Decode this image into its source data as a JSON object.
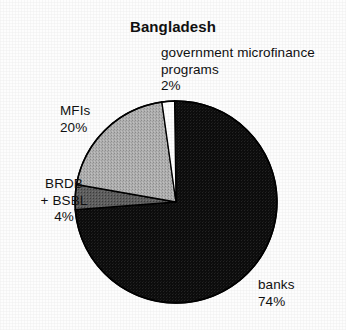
{
  "chart_data": {
    "type": "pie",
    "title": "Bangladesh",
    "xlabel": "",
    "ylabel": "",
    "legend_position": "none",
    "grid": false,
    "categories": [
      "government microfinance programs",
      "banks",
      "BRDB + BSBL",
      "MFIs"
    ],
    "values": [
      2,
      74,
      4,
      20
    ],
    "value_suffix": "%",
    "slice_colors": [
      "#ffffff",
      "#0d0d0d",
      "#5a5a5a",
      "#aaaaaa"
    ],
    "slices": [
      {
        "name": "government microfinance programs",
        "label_lines": [
          "government microfinance",
          "programs",
          "2%"
        ],
        "value": 2,
        "value_text": "2%",
        "color": "#ffffff"
      },
      {
        "name": "banks",
        "label_lines": [
          "banks",
          "74%"
        ],
        "value": 74,
        "value_text": "74%",
        "color": "#0d0d0d"
      },
      {
        "name": "BRDB + BSBL",
        "label_lines": [
          "BRDB",
          "+ BSBL",
          "4%"
        ],
        "value": 4,
        "value_text": "4%",
        "color": "#5a5a5a"
      },
      {
        "name": "MFIs",
        "label_lines": [
          "MFIs",
          "20%"
        ],
        "value": 20,
        "value_text": "20%",
        "color": "#aaaaaa"
      }
    ],
    "start_angle_deg": -8,
    "direction": "clockwise"
  },
  "chart": {
    "title": "Bangladesh",
    "outline_color": "#000000",
    "background": "#fdfdfd",
    "center_x": 176,
    "center_y": 202,
    "radius": 101
  },
  "labels": {
    "government": {
      "line1": "government microfinance",
      "line2": "programs",
      "line3": "2%"
    },
    "mfis": {
      "line1": "MFIs",
      "line2": "20%"
    },
    "brdb": {
      "line1": "BRDB",
      "line2": "+ BSBL",
      "line3": "4%"
    },
    "banks": {
      "line1": "banks",
      "line2": "74%"
    }
  }
}
